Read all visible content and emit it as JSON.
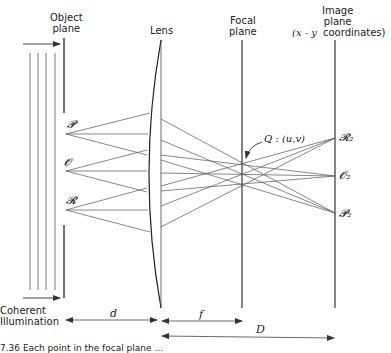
{
  "diagram": {
    "type": "optics-ray-diagram",
    "labels": {
      "object_plane": [
        "Object",
        "plane"
      ],
      "lens": "Lens",
      "focal_plane": [
        "Focal",
        "plane"
      ],
      "image_plane": [
        "Image",
        "plane",
        "(x - y",
        "coordinates)"
      ],
      "illumination": [
        "Coherent",
        "Illumination"
      ]
    },
    "object_points": [
      "𝓟",
      "𝓞",
      "𝓡"
    ],
    "image_points": [
      "𝓡₂",
      "𝓞₂",
      "𝓟₂"
    ],
    "focal_point_label": "Q : (u,v)",
    "dimensions": {
      "d": "d",
      "f": "f",
      "D": "D"
    },
    "caption": "7.36  Each point in the focal plane ..."
  }
}
